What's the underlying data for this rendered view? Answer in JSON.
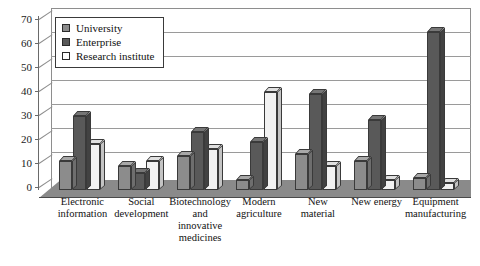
{
  "chart_data": {
    "type": "bar",
    "title": "",
    "subtitle": "",
    "xlabel": "",
    "ylabel": "",
    "ylim": [
      0,
      70
    ],
    "ytick_step": 10,
    "yticks": [
      "70",
      "60",
      "50",
      "40",
      "30",
      "20",
      "10",
      "0"
    ],
    "grid": true,
    "legend_position": "top-left",
    "style": "3d-clustered-column",
    "categories": [
      "Electronic information",
      "Social development",
      "Biotechnology and innovative medicines",
      "Modern agriculture",
      "New material",
      "New energy",
      "Equipment manufacturing"
    ],
    "category_lines": [
      [
        "Electronic",
        "information"
      ],
      [
        "Social",
        "development"
      ],
      [
        "Biotechnology",
        "and",
        "innovative",
        "medicines"
      ],
      [
        "Modern",
        "agriculture"
      ],
      [
        "New",
        "material"
      ],
      [
        "New energy"
      ],
      [
        "Equipment",
        "manufacturing"
      ]
    ],
    "series": [
      {
        "name": "University",
        "color": "#8c8c8c",
        "top_color": "#a8a8a8",
        "side_color": "#6e6e6e",
        "values": [
          12,
          10,
          14,
          4,
          15,
          12,
          5
        ]
      },
      {
        "name": "Enterprise",
        "color": "#595959",
        "top_color": "#767676",
        "side_color": "#424242",
        "values": [
          31,
          7,
          24,
          20,
          40,
          29,
          66
        ]
      },
      {
        "name": "Research institute",
        "color": "#f2f2f2",
        "top_color": "#e0e0e0",
        "side_color": "#c4c4c4",
        "values": [
          19,
          12,
          17,
          41,
          10,
          4,
          3
        ]
      }
    ]
  },
  "legend": {
    "items": [
      {
        "label": "University",
        "swatch": "#8c8c8c"
      },
      {
        "label": "Enterprise",
        "swatch": "#595959"
      },
      {
        "label": "Research institute",
        "swatch": "#ffffff"
      }
    ]
  },
  "colors": {
    "background": "#ffffff",
    "axis": "#6a6a6a",
    "gridline": "#9a9a9a",
    "floor": "#8a8a8a",
    "text": "#111111"
  }
}
